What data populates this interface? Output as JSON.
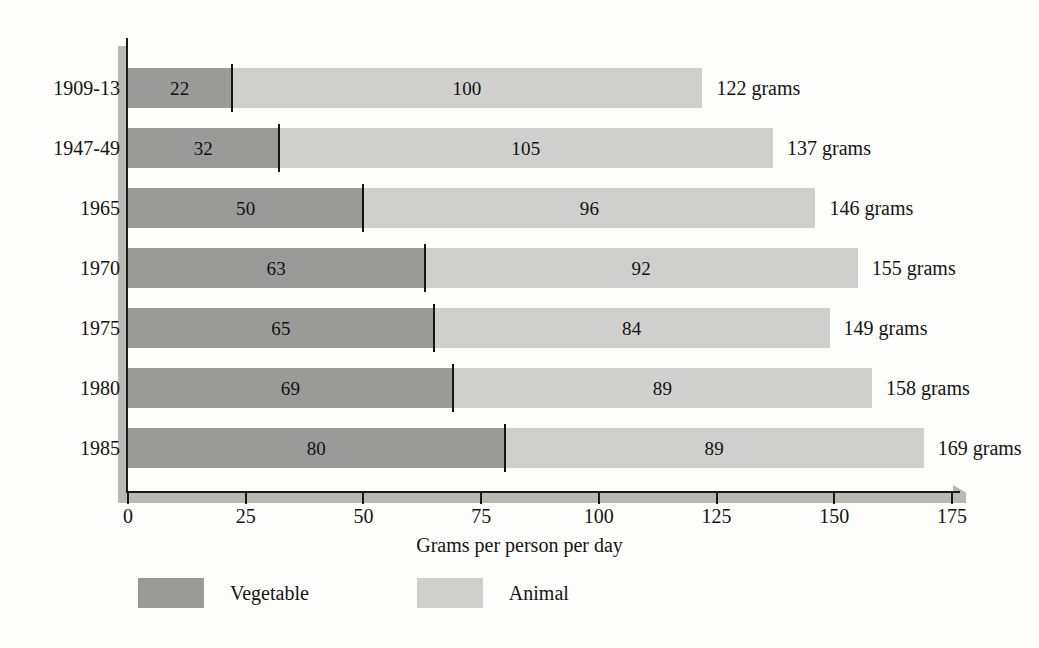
{
  "chart": {
    "type": "bar",
    "orientation": "horizontal",
    "stacked": true
  },
  "chart_data": {
    "type": "bar",
    "title": "",
    "subtitle": "",
    "orientation": "horizontal",
    "stacked": true,
    "xlabel": "Grams per person per day",
    "ylabel": "",
    "xlim": [
      0,
      175
    ],
    "xticks": [
      0,
      25,
      50,
      75,
      100,
      125,
      150,
      175
    ],
    "xtick_labels": [
      "0",
      "25",
      "50",
      "75",
      "100",
      "125",
      "150",
      "175"
    ],
    "grid": false,
    "legend_position": "bottom-left",
    "categories": [
      "1909-13",
      "1947-49",
      "1965",
      "1970",
      "1975",
      "1980",
      "1985"
    ],
    "series": [
      {
        "name": "Vegetable",
        "color": "#9a9a98",
        "values": [
          22,
          32,
          50,
          63,
          65,
          69,
          80
        ]
      },
      {
        "name": "Animal",
        "color": "#cfcfcd",
        "values": [
          100,
          105,
          96,
          92,
          84,
          89,
          89
        ]
      }
    ],
    "totals": [
      122,
      137,
      146,
      155,
      149,
      158,
      169
    ],
    "total_labels": [
      "122 grams",
      "137 grams",
      "146 grams",
      "155 grams",
      "149 grams",
      "158 grams",
      "169 grams"
    ],
    "annotations": []
  },
  "rows": [
    {
      "year": "1909-13",
      "vegetable": 22,
      "animal": 100,
      "veg_label": "22",
      "ani_label": "100",
      "total_label": "122 grams"
    },
    {
      "year": "1947-49",
      "vegetable": 32,
      "animal": 105,
      "veg_label": "32",
      "ani_label": "105",
      "total_label": "137 grams"
    },
    {
      "year": "1965",
      "vegetable": 50,
      "animal": 96,
      "veg_label": "50",
      "ani_label": "96",
      "total_label": "146 grams"
    },
    {
      "year": "1970",
      "vegetable": 63,
      "animal": 92,
      "veg_label": "63",
      "ani_label": "92",
      "total_label": "155 grams"
    },
    {
      "year": "1975",
      "vegetable": 65,
      "animal": 84,
      "veg_label": "65",
      "ani_label": "84",
      "total_label": "149 grams"
    },
    {
      "year": "1980",
      "vegetable": 69,
      "animal": 89,
      "veg_label": "69",
      "ani_label": "89",
      "total_label": "158 grams"
    },
    {
      "year": "1985",
      "vegetable": 80,
      "animal": 89,
      "veg_label": "80",
      "ani_label": "89",
      "total_label": "169 grams"
    }
  ],
  "axis": {
    "x_title": "Grams per person per day",
    "x_tick_labels": [
      "0",
      "25",
      "50",
      "75",
      "100",
      "125",
      "150",
      "175"
    ],
    "x_tick_values": [
      0,
      25,
      50,
      75,
      100,
      125,
      150,
      175
    ]
  },
  "legend": {
    "items": [
      {
        "label": "Vegetable",
        "color": "#9a9a98"
      },
      {
        "label": "Animal",
        "color": "#cfcfcd"
      }
    ]
  },
  "colors": {
    "vegetable": "#9a9a98",
    "animal": "#cfcfcd",
    "axis": "#1a1a1a",
    "axis_shadow": "#b9b9b4",
    "background": "#fdfdfb",
    "text": "#141414"
  }
}
